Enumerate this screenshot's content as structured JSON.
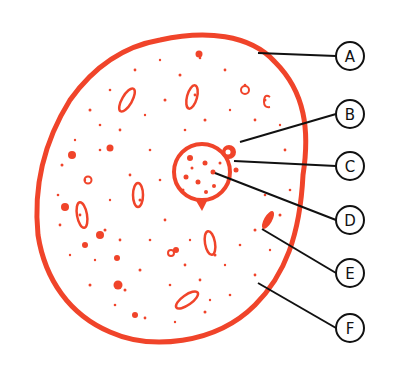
{
  "diagram": {
    "type": "animal-cell",
    "colors": {
      "cell": "#f0442a",
      "leader": "#111111",
      "background": "#ffffff"
    },
    "labels": [
      {
        "letter": "A",
        "cx": 350,
        "cy": 56,
        "lx1": 258,
        "ly1": 53
      },
      {
        "letter": "B",
        "cx": 350,
        "cy": 114,
        "lx1": 240,
        "ly1": 142
      },
      {
        "letter": "C",
        "cx": 350,
        "cy": 166,
        "lx1": 234,
        "ly1": 161
      },
      {
        "letter": "D",
        "cx": 350,
        "cy": 220,
        "lx1": 215,
        "ly1": 173
      },
      {
        "letter": "E",
        "cx": 350,
        "cy": 273,
        "lx1": 262,
        "ly1": 229
      },
      {
        "letter": "F",
        "cx": 350,
        "cy": 328,
        "lx1": 258,
        "ly1": 283
      }
    ]
  }
}
